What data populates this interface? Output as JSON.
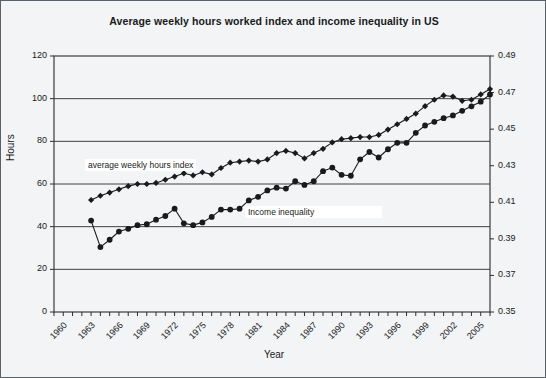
{
  "chart_data": {
    "type": "line",
    "title": "Average weekly hours worked index and income inequality in US",
    "xlabel": "Year",
    "ylabel": "Hours",
    "ylabel_right": "",
    "grid": true,
    "legend_position": "inline-annotation",
    "xlim": [
      1960,
      2007
    ],
    "ylim": [
      0,
      120
    ],
    "ylim_right": [
      0.35,
      0.49
    ],
    "yticks": [
      0,
      20,
      40,
      60,
      80,
      100,
      120
    ],
    "yticks_right": [
      0.35,
      0.37,
      0.39,
      0.41,
      0.43,
      0.45,
      0.47,
      0.49
    ],
    "xticks": [
      1960,
      1963,
      1966,
      1969,
      1972,
      1975,
      1978,
      1981,
      1984,
      1987,
      1990,
      1993,
      1996,
      1999,
      2002,
      2005
    ],
    "annotations": [
      {
        "text": "average weekly hours index",
        "series": "hours_index"
      },
      {
        "text": "Income inequality",
        "series": "income_inequality"
      }
    ],
    "series": [
      {
        "name": "average weekly hours index",
        "axis": "left",
        "marker": "diamond",
        "color": "#1a1a1a",
        "x": [
          1964,
          1965,
          1966,
          1967,
          1968,
          1969,
          1970,
          1971,
          1972,
          1973,
          1974,
          1975,
          1976,
          1977,
          1978,
          1979,
          1980,
          1981,
          1982,
          1983,
          1984,
          1985,
          1986,
          1987,
          1988,
          1989,
          1990,
          1991,
          1992,
          1993,
          1994,
          1995,
          1996,
          1997,
          1998,
          1999,
          2000,
          2001,
          2002,
          2003,
          2004,
          2005,
          2006,
          2007
        ],
        "values": [
          52.5,
          54.5,
          56.0,
          57.5,
          59.0,
          60.0,
          60.0,
          60.5,
          62.0,
          63.5,
          65.0,
          64.0,
          65.5,
          64.5,
          67.5,
          70.0,
          70.5,
          71.0,
          70.5,
          71.5,
          74.5,
          75.5,
          74.5,
          72.0,
          74.5,
          76.5,
          79.5,
          81.0,
          81.5,
          82.0,
          82.0,
          83.0,
          85.5,
          88.0,
          90.5,
          93.0,
          96.5,
          99.5,
          101.5,
          101.0,
          99.0,
          99.5,
          102.0,
          104.5
        ]
      },
      {
        "name": "Income inequality",
        "axis": "right",
        "marker": "circle",
        "color": "#1a1a1a",
        "x": [
          1964,
          1965,
          1966,
          1967,
          1968,
          1969,
          1970,
          1971,
          1972,
          1973,
          1974,
          1975,
          1976,
          1977,
          1978,
          1979,
          1980,
          1981,
          1982,
          1983,
          1984,
          1985,
          1986,
          1987,
          1988,
          1989,
          1990,
          1991,
          1992,
          1993,
          1994,
          1995,
          1996,
          1997,
          1998,
          1999,
          2000,
          2001,
          2002,
          2003,
          2004,
          2005,
          2006,
          2007
        ],
        "values": [
          0.4,
          0.3855,
          0.3895,
          0.394,
          0.3955,
          0.3975,
          0.398,
          0.4005,
          0.4025,
          0.4065,
          0.3985,
          0.3975,
          0.399,
          0.402,
          0.406,
          0.406,
          0.4065,
          0.411,
          0.413,
          0.4165,
          0.418,
          0.4175,
          0.4215,
          0.4195,
          0.4215,
          0.427,
          0.429,
          0.425,
          0.4245,
          0.4335,
          0.4375,
          0.4345,
          0.439,
          0.4425,
          0.4425,
          0.448,
          0.452,
          0.454,
          0.456,
          0.4575,
          0.46,
          0.4625,
          0.465,
          0.469
        ]
      }
    ]
  }
}
